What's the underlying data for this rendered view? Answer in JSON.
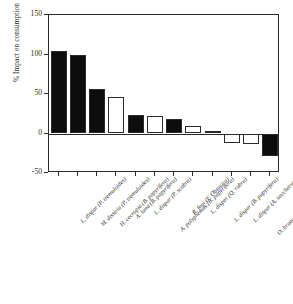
{
  "chart_data": {
    "type": "bar",
    "title": "",
    "xlabel": "",
    "ylabel": "% Impact on consumption",
    "ylim": [
      -50,
      150
    ],
    "yticks": [
      150,
      100,
      50,
      0,
      -50
    ],
    "ytick_labels": [
      "150",
      "100",
      "50",
      "0",
      "-50"
    ],
    "grid": false,
    "legend": null,
    "zero_reference_line": true,
    "categories": [
      "L. dispar (P. tremuloides)",
      "M. disstria (P. tremuloides)",
      "H. cecropia (B. papyrifera)",
      "A. luna (B. papyrifera)",
      "L. dispar (P. scabra)",
      "A. polyphemus (B. papyrifera)",
      "R. fagi (F. Obtusica)",
      "L. dispar (Q. rubra)",
      "L. dispar (B. papyrifera)",
      "L. dispar (A. saccharum)",
      "O. brumata (A. pseudoplatanus)",
      "M. disstria (A. saccharum)"
    ],
    "values": [
      104,
      99,
      56,
      46,
      24,
      22,
      18,
      9,
      3,
      -12,
      -13,
      -29
    ],
    "fills": [
      "filled",
      "filled",
      "filled",
      "open",
      "filled",
      "open",
      "filled",
      "open",
      "open",
      "open",
      "open",
      "filled"
    ],
    "fill_legend": {
      "filled": "#0d0d0d",
      "open": "#ffffff",
      "outline": "#2b2b2b"
    }
  }
}
